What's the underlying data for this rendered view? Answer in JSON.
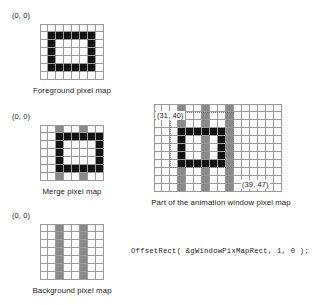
{
  "figure": {
    "code_line": "OffsetRect( &gWindowPixMapRect, 1, 0 );"
  },
  "colors": {
    "black_pixel": "#121212",
    "gray_pixel": "#8a8a8a",
    "white_pixel": "#ffffff",
    "gridline": "#9a9a9a",
    "text": "#1a1a1a"
  },
  "panels": [
    {
      "id": "foreground",
      "caption": "Foreground pixel map",
      "origin_label": "(0, 0)",
      "cols": 8,
      "rows": 7,
      "cells": [
        [
          "w",
          "w",
          "w",
          "w",
          "w",
          "w",
          "w",
          "w"
        ],
        [
          "w",
          "k",
          "k",
          "k",
          "k",
          "k",
          "k",
          "w"
        ],
        [
          "w",
          "k",
          "w",
          "w",
          "w",
          "w",
          "k",
          "w"
        ],
        [
          "w",
          "k",
          "w",
          "w",
          "w",
          "w",
          "k",
          "w"
        ],
        [
          "w",
          "k",
          "w",
          "w",
          "w",
          "w",
          "k",
          "w"
        ],
        [
          "w",
          "k",
          "k",
          "k",
          "k",
          "k",
          "k",
          "w"
        ],
        [
          "w",
          "w",
          "w",
          "w",
          "w",
          "w",
          "w",
          "w"
        ]
      ]
    },
    {
      "id": "merge",
      "caption": "Merge pixel map",
      "origin_label": "(0, 0)",
      "cols": 8,
      "rows": 7,
      "cells": [
        [
          "w",
          "w",
          "g",
          "w",
          "w",
          "g",
          "w",
          "w"
        ],
        [
          "w",
          "w",
          "k",
          "k",
          "k",
          "k",
          "k",
          "k"
        ],
        [
          "w",
          "w",
          "k",
          "w",
          "w",
          "w",
          "w",
          "k"
        ],
        [
          "w",
          "w",
          "k",
          "w",
          "w",
          "w",
          "w",
          "k"
        ],
        [
          "w",
          "w",
          "k",
          "w",
          "w",
          "w",
          "w",
          "k"
        ],
        [
          "w",
          "w",
          "k",
          "k",
          "k",
          "k",
          "k",
          "k"
        ],
        [
          "w",
          "w",
          "g",
          "w",
          "w",
          "g",
          "w",
          "w"
        ]
      ]
    },
    {
      "id": "background",
      "caption": "Background pixel map",
      "origin_label": "(0, 0)",
      "cols": 8,
      "rows": 7,
      "cells": [
        [
          "w",
          "w",
          "g",
          "w",
          "w",
          "g",
          "w",
          "w"
        ],
        [
          "w",
          "w",
          "g",
          "w",
          "w",
          "g",
          "w",
          "w"
        ],
        [
          "w",
          "w",
          "g",
          "w",
          "w",
          "g",
          "w",
          "w"
        ],
        [
          "w",
          "w",
          "g",
          "w",
          "w",
          "g",
          "w",
          "w"
        ],
        [
          "w",
          "w",
          "g",
          "w",
          "w",
          "g",
          "w",
          "w"
        ],
        [
          "w",
          "w",
          "g",
          "w",
          "w",
          "g",
          "w",
          "w"
        ],
        [
          "w",
          "w",
          "g",
          "w",
          "w",
          "g",
          "w",
          "w"
        ]
      ]
    }
  ],
  "window_panel": {
    "id": "animation-window",
    "caption": "Part of the animation window pixel map",
    "top_left_label": "(31, 40)",
    "bottom_right_label": "(39, 47)",
    "cols": 16,
    "rows": 11,
    "cells": [
      [
        "w",
        "w",
        "w",
        "g",
        "w",
        "w",
        "g",
        "w",
        "w",
        "g",
        "w",
        "w",
        "w",
        "w",
        "w",
        "w"
      ],
      [
        "w",
        "w",
        "w",
        "g",
        "w",
        "w",
        "g",
        "w",
        "w",
        "g",
        "w",
        "w",
        "w",
        "w",
        "w",
        "w"
      ],
      [
        "w",
        "w",
        "w",
        "g",
        "w",
        "w",
        "g",
        "w",
        "w",
        "g",
        "w",
        "w",
        "w",
        "w",
        "w",
        "w"
      ],
      [
        "w",
        "w",
        "w",
        "k",
        "k",
        "k",
        "k",
        "k",
        "k",
        "g",
        "w",
        "w",
        "w",
        "w",
        "w",
        "w"
      ],
      [
        "w",
        "w",
        "w",
        "k",
        "w",
        "w",
        "g",
        "w",
        "k",
        "g",
        "w",
        "w",
        "w",
        "w",
        "w",
        "w"
      ],
      [
        "w",
        "w",
        "w",
        "k",
        "w",
        "w",
        "g",
        "w",
        "k",
        "g",
        "w",
        "w",
        "w",
        "w",
        "w",
        "w"
      ],
      [
        "w",
        "w",
        "w",
        "k",
        "w",
        "w",
        "g",
        "w",
        "k",
        "g",
        "w",
        "w",
        "w",
        "w",
        "w",
        "w"
      ],
      [
        "w",
        "w",
        "w",
        "k",
        "k",
        "k",
        "k",
        "k",
        "k",
        "g",
        "w",
        "w",
        "w",
        "w",
        "w",
        "w"
      ],
      [
        "w",
        "w",
        "w",
        "g",
        "w",
        "w",
        "g",
        "w",
        "w",
        "g",
        "w",
        "w",
        "w",
        "w",
        "w",
        "w"
      ],
      [
        "w",
        "w",
        "w",
        "g",
        "w",
        "w",
        "g",
        "w",
        "w",
        "g",
        "w",
        "w",
        "w",
        "w",
        "w",
        "w"
      ],
      [
        "w",
        "w",
        "w",
        "g",
        "w",
        "w",
        "g",
        "w",
        "w",
        "g",
        "w",
        "w",
        "w",
        "w",
        "w",
        "w"
      ]
    ],
    "selection_rect": {
      "start_col": 2,
      "start_row": 1,
      "cols": 8,
      "rows": 7
    }
  }
}
